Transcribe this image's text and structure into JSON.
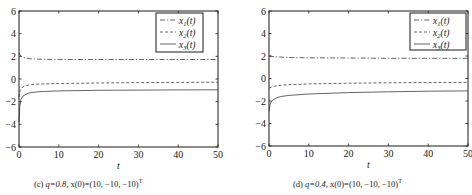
{
  "chart_data": [
    {
      "type": "line",
      "panel": "c",
      "caption": {
        "label": "(c)",
        "q": "q=0.8,",
        "init": "x(0)=(10, −10, −10)",
        "sup": "T"
      },
      "xlabel": "t",
      "ylabel": "",
      "xlim": [
        0,
        50
      ],
      "ylim": [
        -6,
        6
      ],
      "xticks": [
        0,
        10,
        20,
        30,
        40,
        50
      ],
      "yticks": [
        -6,
        -4,
        -2,
        0,
        2,
        4,
        6
      ],
      "grid": false,
      "legend_position": "upper right",
      "series": [
        {
          "name": "x1(t)",
          "style": "dashdot",
          "x": [
            0,
            0.3,
            0.8,
            1.5,
            3,
            5,
            10,
            20,
            30,
            40,
            50
          ],
          "y": [
            2.3,
            2.1,
            1.95,
            1.85,
            1.78,
            1.75,
            1.72,
            1.72,
            1.72,
            1.72,
            1.72
          ]
        },
        {
          "name": "x2(t)",
          "style": "dashed",
          "x": [
            0,
            0.3,
            0.8,
            1.5,
            3,
            5,
            10,
            20,
            30,
            40,
            50
          ],
          "y": [
            -1.6,
            -1.0,
            -0.75,
            -0.6,
            -0.5,
            -0.45,
            -0.4,
            -0.35,
            -0.32,
            -0.3,
            -0.28
          ]
        },
        {
          "name": "x3(t)",
          "style": "solid",
          "x": [
            0,
            0.2,
            0.5,
            1,
            2,
            3,
            5,
            10,
            20,
            30,
            40,
            50
          ],
          "y": [
            -3.8,
            -2.4,
            -1.8,
            -1.5,
            -1.3,
            -1.2,
            -1.12,
            -1.05,
            -1.0,
            -0.98,
            -0.96,
            -0.95
          ]
        }
      ]
    },
    {
      "type": "line",
      "panel": "d",
      "caption": {
        "label": "(d)",
        "q": "q=0.4,",
        "init": "x(0)=(10, −10, −10)",
        "sup": "T"
      },
      "xlabel": "t",
      "ylabel": "",
      "xlim": [
        0,
        50
      ],
      "ylim": [
        -6,
        6
      ],
      "xticks": [
        0,
        10,
        20,
        30,
        40,
        50
      ],
      "yticks": [
        -6,
        -4,
        -2,
        0,
        2,
        4,
        6
      ],
      "grid": false,
      "legend_position": "upper right",
      "series": [
        {
          "name": "x1(t)",
          "style": "dashdot",
          "x": [
            0,
            1,
            3,
            5,
            10,
            20,
            30,
            40,
            50
          ],
          "y": [
            2.0,
            1.95,
            1.9,
            1.87,
            1.84,
            1.82,
            1.8,
            1.8,
            1.79
          ]
        },
        {
          "name": "x2(t)",
          "style": "dashed",
          "x": [
            0,
            1,
            3,
            5,
            10,
            20,
            30,
            40,
            50
          ],
          "y": [
            -0.85,
            -0.7,
            -0.6,
            -0.55,
            -0.48,
            -0.42,
            -0.38,
            -0.36,
            -0.34
          ]
        },
        {
          "name": "x3(t)",
          "style": "solid",
          "x": [
            0,
            0.2,
            0.5,
            1,
            2,
            3,
            5,
            10,
            20,
            30,
            40,
            50
          ],
          "y": [
            -2.9,
            -2.4,
            -2.1,
            -1.9,
            -1.7,
            -1.6,
            -1.5,
            -1.38,
            -1.25,
            -1.18,
            -1.13,
            -1.1
          ]
        }
      ]
    }
  ],
  "legend": {
    "x1": {
      "base": "x",
      "sub": "1",
      "suffix": "(t)"
    },
    "x2": {
      "base": "x",
      "sub": "2",
      "suffix": "(t)"
    },
    "x3": {
      "base": "x",
      "sub": "3",
      "suffix": "(t)"
    }
  },
  "colors": {
    "axis": "#1a1a1a",
    "line": "#555555",
    "text": "#222222"
  }
}
